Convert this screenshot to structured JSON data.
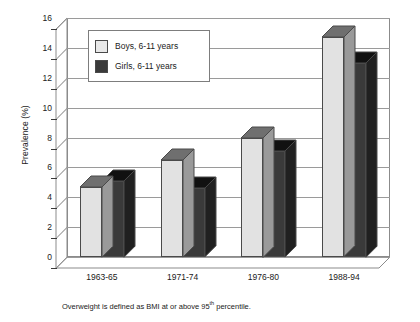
{
  "chart_data": {
    "type": "bar",
    "title": "",
    "subtitle": "",
    "xlabel": "",
    "ylabel": "Prevalence (%)",
    "ylim": [
      0,
      16
    ],
    "yticks": [
      0,
      2,
      4,
      6,
      8,
      10,
      12,
      14,
      16
    ],
    "ytick_labels": [
      "0",
      "2",
      "4",
      "6",
      "8",
      "10",
      "12",
      "14",
      "16"
    ],
    "grid": true,
    "legend_position": "upper left",
    "style": "3d-clustered-column",
    "categories": [
      "1963-65",
      "1971-74",
      "1976-80",
      "1988-94"
    ],
    "series": [
      {
        "name": "Boys, 6-11 years",
        "color": "#e2e2e2",
        "values": [
          4.7,
          6.5,
          8.0,
          14.7
        ]
      },
      {
        "name": "Girls, 6-11 years",
        "color": "#3a3a3a",
        "values": [
          5.1,
          4.6,
          7.1,
          13.0
        ]
      }
    ],
    "annotations": [
      "Overweight is defined as BMI at or above 95th percentile."
    ]
  },
  "legend": {
    "entries": [
      {
        "label": "Boys, 6-11 years",
        "swatch": "light-gray"
      },
      {
        "label": "Girls, 6-11 years",
        "swatch": "dark-gray"
      }
    ]
  },
  "footnote": {
    "text_before": "Overweight is defined as BMI at or above 95",
    "superscript": "th",
    "text_after": " percentile."
  }
}
